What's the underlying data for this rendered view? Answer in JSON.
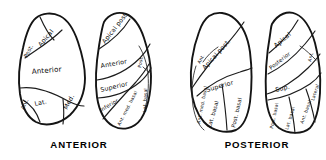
{
  "figure": {
    "background_color": "#ffffff",
    "ink_color": "#141414",
    "panels": [
      {
        "id": "anterior",
        "caption": "ANTERIOR",
        "lungs": [
          {
            "id": "anterior-left-lung",
            "side": "left",
            "segments": [
              {
                "id": "ant-left-post",
                "label": "Post."
              },
              {
                "id": "ant-left-apical",
                "label": "Apical"
              },
              {
                "id": "ant-left-anterior",
                "label": "Anterior"
              },
              {
                "id": "ant-left-lat",
                "label": "Lat."
              },
              {
                "id": "ant-left-med",
                "label": "Med."
              },
              {
                "id": "ant-left-ant",
                "label": "Ant."
              }
            ]
          },
          {
            "id": "anterior-right-lung",
            "side": "right",
            "segments": [
              {
                "id": "ant-right-apical-post",
                "label": "Apical post."
              },
              {
                "id": "ant-right-anterior",
                "label": "Anterior"
              },
              {
                "id": "ant-right-superior",
                "label": "Superior"
              },
              {
                "id": "ant-right-inferior",
                "label": "Inferior"
              },
              {
                "id": "ant-right-ant-med-basal",
                "label": "Ant. med. basal"
              },
              {
                "id": "ant-right-post",
                "label": "Post."
              },
              {
                "id": "ant-right-lat-basal",
                "label": "Lat. basal"
              }
            ]
          }
        ]
      },
      {
        "id": "posterior",
        "caption": "POSTERIOR",
        "lungs": [
          {
            "id": "posterior-left-lung",
            "side": "left",
            "segments": [
              {
                "id": "post-left-apical-post",
                "label": "Apical post."
              },
              {
                "id": "post-left-ant",
                "label": "Ant."
              },
              {
                "id": "post-left-superior",
                "label": "Superior"
              },
              {
                "id": "post-left-ant-med-basal",
                "label": "Ant. med. basal"
              },
              {
                "id": "post-left-lat-basal",
                "label": "Lat. basal"
              },
              {
                "id": "post-left-post-basal",
                "label": "Post. basal"
              }
            ]
          },
          {
            "id": "posterior-right-lung",
            "side": "right",
            "segments": [
              {
                "id": "post-right-apical",
                "label": "Apical"
              },
              {
                "id": "post-right-posterior",
                "label": "Posterior"
              },
              {
                "id": "post-right-ant",
                "label": "Ant."
              },
              {
                "id": "post-right-sup",
                "label": "Sup."
              },
              {
                "id": "post-right-lateral",
                "label": "Lateral"
              },
              {
                "id": "post-right-post-basal",
                "label": "Post. basal"
              },
              {
                "id": "post-right-lat-basal",
                "label": "Lat. basal"
              },
              {
                "id": "post-right-ant-basal",
                "label": "Ant. basal"
              }
            ]
          }
        ]
      }
    ]
  }
}
